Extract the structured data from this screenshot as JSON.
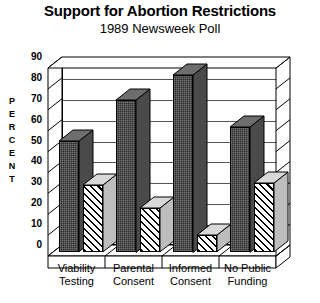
{
  "chart_data": {
    "type": "bar",
    "title": "Support for Abortion Restrictions",
    "subtitle": "1989 Newsweek Poll",
    "xlabel": "",
    "ylabel": "PERCENT",
    "ylim": [
      0,
      90
    ],
    "ytick_step": 10,
    "yticks": [
      "90",
      "80",
      "70",
      "60",
      "50",
      "40",
      "30",
      "20",
      "10",
      "0"
    ],
    "grid": true,
    "legend": "none",
    "style": "3d-bar",
    "categories": [
      "Viability Testing",
      "Parental Consent",
      "Informed Consent",
      "No Public Funding"
    ],
    "category_lines": [
      [
        "Viability",
        "Testing"
      ],
      [
        "Parental",
        "Consent"
      ],
      [
        "Informed",
        "Consent"
      ],
      [
        "No Public",
        "Funding"
      ]
    ],
    "series": [
      {
        "name": "Favor",
        "fill": "dark",
        "values": [
          53,
          73,
          85,
          60
        ]
      },
      {
        "name": "Oppose",
        "fill": "hatched",
        "values": [
          32,
          21,
          8,
          33
        ]
      }
    ]
  },
  "axis_title_letters": [
    "P",
    "E",
    "R",
    "C",
    "E",
    "N",
    "T"
  ],
  "colors": {
    "background": "#ffffff",
    "ink": "#000000",
    "gridline": "#555555",
    "bar_dark": "#2b2b2b",
    "bar_hatch_bg": "#ffffff"
  }
}
